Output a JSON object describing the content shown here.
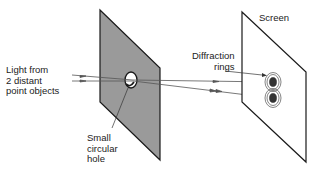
{
  "diagram": {
    "labels": {
      "light_source": [
        "Light from",
        "2 distant",
        "point objects"
      ],
      "hole": [
        "Small",
        "circular",
        "hole"
      ],
      "diffraction": [
        "Diffraction",
        "rings"
      ],
      "screen": "Screen"
    },
    "colors": {
      "barrier_fill": "#9a9a9a",
      "outline": "#1a1a1a",
      "screen_fill": "#ffffff",
      "ray": "#555555"
    }
  }
}
